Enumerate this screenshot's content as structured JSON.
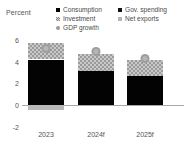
{
  "axis_title": "Percent",
  "legend": {
    "items": [
      {
        "label": "Consumption",
        "key": "consumption",
        "marker": "square-black"
      },
      {
        "label": "Gov. spending",
        "key": "gov",
        "marker": "square-black"
      },
      {
        "label": "Investment",
        "key": "investment",
        "marker": "square-hatched-gray"
      },
      {
        "label": "Net exports",
        "key": "netexports",
        "marker": "square-light-gray"
      },
      {
        "label": "GDP growth",
        "key": "gdp",
        "marker": "circle-gray"
      }
    ]
  },
  "chart_data": {
    "type": "bar",
    "stacked": true,
    "title": "",
    "xlabel": "",
    "ylabel": "Percent",
    "ylim": [
      -2,
      6
    ],
    "yticks": [
      6,
      4,
      2,
      0,
      -2
    ],
    "ytick_labels": [
      "6",
      "4",
      "2",
      "0",
      "-2"
    ],
    "grid": false,
    "legend_position": "top",
    "categories": [
      "2023",
      "2024f",
      "2025f"
    ],
    "series": [
      {
        "name": "Consumption",
        "values": [
          4.2,
          3.1,
          2.7
        ]
      },
      {
        "name": "Investment",
        "values": [
          1.55,
          1.65,
          1.45
        ]
      },
      {
        "name": "Gov. spending",
        "values": [
          0.0,
          0.0,
          0.0
        ]
      },
      {
        "name": "Net exports",
        "values": [
          -0.45,
          0.0,
          0.0
        ]
      }
    ],
    "overlay": {
      "name": "GDP growth",
      "values": [
        5.2,
        4.9,
        4.3
      ]
    }
  }
}
